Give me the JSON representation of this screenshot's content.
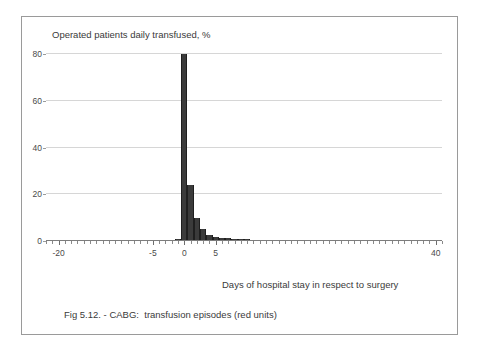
{
  "figure": {
    "caption": "Fig 5.12. - CABG:  transfusion episodes (red units)",
    "border_color": "#9a9a9a"
  },
  "chart_data": {
    "type": "bar",
    "title": "Operated patients daily transfused, %",
    "xlabel": "Days of hospital stay in respect to surgery",
    "ylabel": "",
    "xlim": [
      -22,
      41
    ],
    "ylim": [
      0,
      80
    ],
    "grid": true,
    "legend": null,
    "bar_color": "#3b3b3b",
    "x_tick_labels": [
      "-20",
      "-5",
      "0",
      "5",
      "40"
    ],
    "x_tick_values": [
      -20,
      -5,
      0,
      5,
      40
    ],
    "y_tick_labels": [
      "0",
      "20",
      "40",
      "60",
      "80"
    ],
    "y_tick_values": [
      0,
      20,
      40,
      60,
      80
    ],
    "x": [
      -2,
      -1,
      0,
      1,
      2,
      3,
      4,
      5,
      6,
      7,
      8,
      9,
      10,
      11,
      12,
      13,
      14,
      15,
      16,
      17,
      18,
      19,
      20,
      21,
      22,
      23,
      24,
      25,
      26,
      27,
      28,
      29,
      30,
      31,
      32,
      33,
      34,
      35,
      36,
      37,
      38
    ],
    "values": [
      0.4,
      0.8,
      80.0,
      24.0,
      10.0,
      5.0,
      2.6,
      1.8,
      1.5,
      1.3,
      0.9,
      1.0,
      0.7,
      0.6,
      0.6,
      0.5,
      0.5,
      0.4,
      0.4,
      0.4,
      0.3,
      0.3,
      0.3,
      0.2,
      0.2,
      0.2,
      0.2,
      0.2,
      0.2,
      0.2,
      0.2,
      0.2,
      0.2,
      0.2,
      0.2,
      0.2,
      0.2,
      0.3,
      0.2,
      0.2,
      0.2
    ]
  }
}
